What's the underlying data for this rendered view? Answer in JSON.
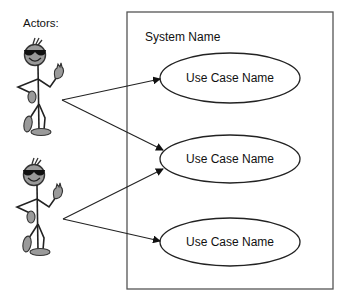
{
  "diagram": {
    "type": "uml-use-case",
    "actors_label": "Actors:",
    "system": {
      "name": "System Name",
      "border_color": "#555555"
    },
    "actors": [
      {
        "id": "actor-1",
        "icon": "stick-figure-sunglasses-icon"
      },
      {
        "id": "actor-2",
        "icon": "stick-figure-sunglasses-icon"
      }
    ],
    "use_cases": [
      {
        "id": "uc-1",
        "label": "Use Case Name"
      },
      {
        "id": "uc-2",
        "label": "Use Case Name"
      },
      {
        "id": "uc-3",
        "label": "Use Case Name"
      }
    ],
    "associations": [
      {
        "from": "actor-1",
        "to": "uc-1"
      },
      {
        "from": "actor-1",
        "to": "uc-2"
      },
      {
        "from": "actor-2",
        "to": "uc-2"
      },
      {
        "from": "actor-2",
        "to": "uc-3"
      }
    ]
  }
}
